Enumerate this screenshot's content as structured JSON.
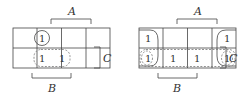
{
  "maps": [
    {
      "id": "left",
      "labels": {
        "A": "A",
        "B": "B",
        "C": "C"
      },
      "cells": [
        [
          "",
          "1",
          "",
          ""
        ],
        [
          "",
          "1",
          "1",
          ""
        ]
      ],
      "groups": [
        {
          "type": "solid",
          "cells": [
            [
              0,
              1
            ]
          ]
        },
        {
          "type": "dashed",
          "cells": [
            [
              1,
              1
            ],
            [
              1,
              2
            ]
          ]
        }
      ]
    },
    {
      "id": "right",
      "labels": {
        "A": "A",
        "B": "B",
        "C": "C"
      },
      "cells": [
        [
          "1",
          "",
          "",
          "1"
        ],
        [
          "1",
          "1",
          "1",
          "1"
        ]
      ],
      "groups": [
        {
          "type": "solid-wrap",
          "cells": [
            [
              0,
              0
            ],
            [
              1,
              0
            ],
            [
              0,
              3
            ],
            [
              1,
              3
            ]
          ]
        },
        {
          "type": "dashed",
          "cells": [
            [
              1,
              0
            ],
            [
              1,
              1
            ],
            [
              1,
              2
            ],
            [
              1,
              3
            ]
          ]
        }
      ]
    }
  ]
}
